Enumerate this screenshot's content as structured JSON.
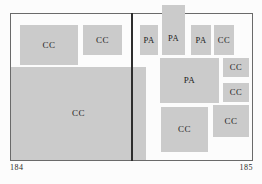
{
  "figure": {
    "left_page_number": "184",
    "right_page_number": "185",
    "blocks": {
      "cc_a": {
        "label": "CC"
      },
      "cc_b": {
        "label": "CC"
      },
      "cc_big": {
        "label": "CC"
      },
      "pa_1": {
        "label": "PA"
      },
      "pa_2": {
        "label": "PA"
      },
      "pa_3": {
        "label": "PA"
      },
      "cc_d": {
        "label": "CC"
      },
      "pa_mid": {
        "label": "PA"
      },
      "cc_e": {
        "label": "CC"
      },
      "cc_f": {
        "label": "CC"
      },
      "cc_g": {
        "label": "CC"
      },
      "cc_h": {
        "label": "CC"
      }
    },
    "colors": {
      "block_fill": "#cbcbcb",
      "border": "#6a6a6a",
      "divider": "#2d2d2d",
      "label_text": "#222222",
      "background": "#fcfcfc"
    }
  }
}
